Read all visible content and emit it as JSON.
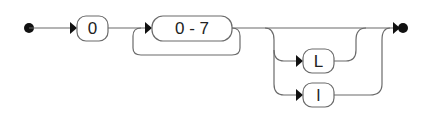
{
  "diagram": {
    "type": "railroad",
    "nodes": {
      "zero": "0",
      "range": "0 - 7",
      "upper_l": "L",
      "lower_l": "l"
    },
    "structure": "start → '0' → one-or-more('0 - 7') → optional(choice('L' | 'l')) → end",
    "colors": {
      "track": "#6b6b6b",
      "terminal_marker": "#111111",
      "background": "#ffffff"
    }
  }
}
